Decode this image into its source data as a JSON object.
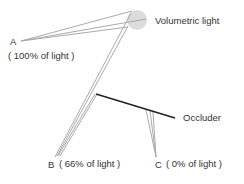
{
  "diagram": {
    "light": {
      "label": "Volumetric light",
      "center": [
        137,
        20
      ],
      "radius": 10,
      "color": "#dddddd"
    },
    "occluder": {
      "label": "Occluder",
      "from": [
        96,
        94
      ],
      "to": [
        175,
        118
      ],
      "color": "#222222"
    },
    "points": [
      {
        "id": "A",
        "label": "A",
        "sublabel": "( 100% of light )",
        "position": [
          20,
          41
        ]
      },
      {
        "id": "B",
        "label": "B",
        "sublabel": "( 66% of light )",
        "position": [
          55,
          157
        ]
      },
      {
        "id": "C",
        "label": "C",
        "sublabel": "( 0% of light )",
        "position": [
          156,
          157
        ]
      }
    ],
    "ray_color": "#b0b0b0"
  }
}
